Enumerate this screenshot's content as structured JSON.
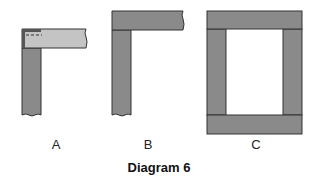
{
  "diagram": {
    "caption": "Diagram 6",
    "figures": [
      {
        "id": "A",
        "label": "A",
        "description": "Corner joint: light horizontal member overlapping top of dark vertical member, hidden dashed line"
      },
      {
        "id": "B",
        "label": "B",
        "description": "Corner joint: horizontal member on top of vertical member"
      },
      {
        "id": "C",
        "label": "C",
        "description": "Rectangular frame: top and bottom rails spanning full width, stiles between"
      }
    ],
    "colors": {
      "dark_member": "#8a8a8a",
      "light_member": "#c4c4c4",
      "corner": "#555555",
      "outline": "#333333"
    }
  }
}
